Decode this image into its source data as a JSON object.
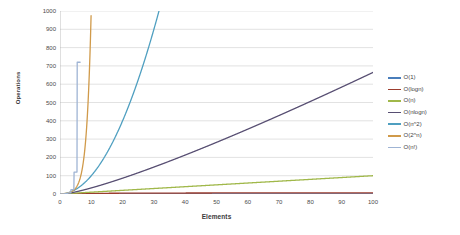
{
  "chart_data": {
    "type": "line",
    "title": "",
    "xlabel": "Elements",
    "ylabel": "Operations",
    "xlim": [
      0,
      100
    ],
    "ylim": [
      0,
      1000
    ],
    "grid": true,
    "legend_position": "right",
    "x_ticks": [
      0,
      10,
      20,
      30,
      40,
      50,
      60,
      70,
      80,
      90,
      100
    ],
    "y_ticks": [
      0,
      100,
      200,
      300,
      400,
      500,
      600,
      700,
      800,
      900,
      1000
    ],
    "x": [
      0,
      5,
      10,
      15,
      20,
      25,
      30,
      35,
      40,
      45,
      50,
      55,
      60,
      65,
      70,
      75,
      80,
      85,
      90,
      95,
      100
    ],
    "series": [
      {
        "name": "O(1)",
        "color": "#4a7ebb",
        "values": [
          1,
          1,
          1,
          1,
          1,
          1,
          1,
          1,
          1,
          1,
          1,
          1,
          1,
          1,
          1,
          1,
          1,
          1,
          1,
          1,
          1
        ]
      },
      {
        "name": "O(logn)",
        "color": "#9c3d2e",
        "values": [
          0,
          2.3,
          3.3,
          3.9,
          4.3,
          4.6,
          4.9,
          5.1,
          5.3,
          5.5,
          5.6,
          5.8,
          5.9,
          6.0,
          6.1,
          6.2,
          6.3,
          6.4,
          6.5,
          6.6,
          6.6
        ]
      },
      {
        "name": "O(n)",
        "color": "#a0b84a",
        "values": [
          0,
          5,
          10,
          15,
          20,
          25,
          30,
          35,
          40,
          45,
          50,
          55,
          60,
          65,
          70,
          75,
          80,
          85,
          90,
          95,
          100
        ]
      },
      {
        "name": "O(nlogn)",
        "color": "#574e72",
        "values": [
          0,
          11.6,
          33.2,
          58.6,
          86.4,
          116.1,
          147.2,
          179.5,
          212.9,
          247.1,
          282.2,
          318.0,
          354.4,
          391.5,
          429.1,
          467.2,
          505.8,
          544.8,
          584.3,
          624.1,
          664.4
        ]
      },
      {
        "name": "O(n^2)",
        "color": "#4f9fc0",
        "values": [
          0,
          25,
          100,
          225,
          400,
          625,
          900,
          1225,
          1600,
          2025,
          2500,
          3025,
          3600,
          4225,
          4900,
          5625,
          6400,
          7225,
          8100,
          9025,
          10000
        ]
      },
      {
        "name": "O(2^n)",
        "color": "#d09a4a",
        "values": [
          1,
          32,
          1024,
          32768,
          1048576,
          33554432,
          1073741824,
          100000000000.0,
          1000000000000.0,
          10000000000000.0,
          100000000000000.0,
          1000000000000000.0,
          1e+16,
          1e+17,
          1e+18,
          1e+19,
          1e+20,
          1e+21,
          1e+22,
          1e+23,
          1e+24
        ]
      },
      {
        "name": "O(n!)",
        "color": "#9fb4d4",
        "values": [
          1,
          120,
          3628800,
          1300000000000.0,
          2.4e+18,
          1.55e+25,
          2.65e+32,
          1.03e+40,
          8.16e+47,
          1.2e+56,
          3.04e+64,
          1.27e+73,
          8.32e+81,
          8.25e+90,
          1.2e+100,
          2.48e+109,
          7.16e+118,
          2.82e+128,
          1.49e+139,
          1.03e+148,
          9.33e+157
        ]
      }
    ]
  },
  "axes": {
    "y_title": "Operations",
    "x_title": "Elements",
    "y_tick_labels": [
      "1000",
      "900",
      "800",
      "700",
      "600",
      "500",
      "400",
      "300",
      "200",
      "100",
      "0"
    ],
    "x_tick_labels": [
      "0",
      "10",
      "20",
      "30",
      "40",
      "50",
      "60",
      "70",
      "80",
      "90",
      "100"
    ]
  },
  "legend": {
    "items": [
      {
        "label": "O(1)",
        "color": "#4a7ebb"
      },
      {
        "label": "O(logn)",
        "color": "#9c3d2e"
      },
      {
        "label": "O(n)",
        "color": "#a0b84a"
      },
      {
        "label": "O(nlogn)",
        "color": "#574e72"
      },
      {
        "label": "O(n^2)",
        "color": "#4f9fc0"
      },
      {
        "label": "O(2^n)",
        "color": "#d09a4a"
      },
      {
        "label": "O(n!)",
        "color": "#9fb4d4"
      }
    ]
  }
}
